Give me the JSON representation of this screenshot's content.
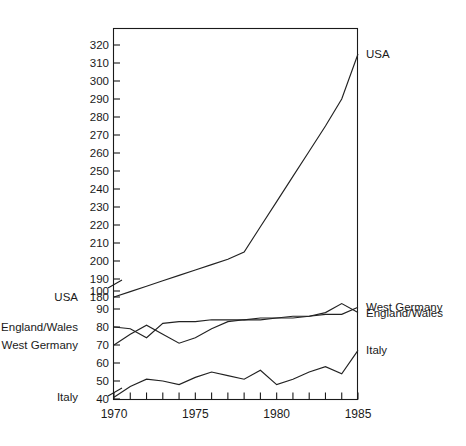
{
  "figure": {
    "faint_top_caption": "",
    "background_color": "#ffffff",
    "line_color": "#222222",
    "axis_color": "#1a1a1a"
  },
  "chart_data": {
    "type": "line",
    "title": "",
    "subtitle": "",
    "xlabel": "",
    "ylabel": "",
    "grid": false,
    "legend_position": "inline-end-labels",
    "axis_break": true,
    "axis_break_note": "Y axis is broken between 100 and 180; upper panel 180-320, lower panel 40-100",
    "xlim": [
      1970,
      1985
    ],
    "x_tick_labels": [
      "1970",
      "1975",
      "1980",
      "1985"
    ],
    "x_major_ticks": [
      1970,
      1975,
      1980,
      1985
    ],
    "x_minor_ticks": [
      1971,
      1972,
      1973,
      1974,
      1976,
      1977,
      1978,
      1979,
      1981,
      1982,
      1983,
      1984
    ],
    "upper_panel": {
      "ylim": [
        180,
        325
      ],
      "y_ticks": [
        180,
        190,
        200,
        210,
        220,
        230,
        240,
        250,
        260,
        270,
        280,
        290,
        300,
        310,
        320
      ],
      "y_tick_labels": [
        "180",
        "190",
        "200",
        "210",
        "220",
        "230",
        "240",
        "250",
        "260",
        "270",
        "280",
        "290",
        "300",
        "310",
        "320"
      ]
    },
    "lower_panel": {
      "ylim": [
        38,
        104
      ],
      "y_ticks": [
        40,
        50,
        60,
        70,
        80,
        90,
        100
      ],
      "y_tick_labels": [
        "40",
        "50",
        "60",
        "70",
        "80",
        "90",
        "100"
      ]
    },
    "x": [
      1970,
      1971,
      1972,
      1973,
      1974,
      1975,
      1976,
      1977,
      1978,
      1979,
      1980,
      1981,
      1982,
      1983,
      1984,
      1985
    ],
    "series": [
      {
        "name": "USA",
        "panel": "upper",
        "left_label": "USA",
        "left_label_value": "180",
        "right_label": "USA",
        "values": [
          180,
          183,
          186,
          189,
          192,
          195,
          198,
          201,
          205,
          219,
          233,
          247,
          261,
          275,
          290,
          315
        ]
      },
      {
        "name": "England/Wales",
        "panel": "lower",
        "left_label": "England/Wales",
        "left_label_value": "80",
        "right_label": "England/Wales",
        "values": [
          80,
          79,
          74,
          82,
          83,
          83,
          84,
          84,
          84,
          85,
          85,
          85,
          86,
          88,
          93,
          88
        ]
      },
      {
        "name": "West Germany",
        "panel": "lower",
        "left_label": "West Germany",
        "left_label_value": "70",
        "right_label": "West Germany",
        "values": [
          70,
          76,
          81,
          76,
          71,
          74,
          79,
          83,
          84,
          84,
          85,
          86,
          86,
          87,
          87,
          91
        ]
      },
      {
        "name": "Italy",
        "panel": "lower",
        "left_label": "Italy",
        "left_label_value": "40",
        "right_label": "Italy",
        "values": [
          41,
          47,
          51,
          50,
          48,
          52,
          55,
          53,
          51,
          56,
          48,
          51,
          55,
          58,
          54,
          67
        ]
      }
    ]
  }
}
